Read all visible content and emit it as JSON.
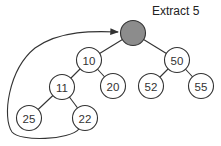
{
  "title": "Extract 5",
  "colors": {
    "node_fill": "#ffffff",
    "node_stroke": "#333333",
    "extracted_fill": "#8c8c8c",
    "edge": "#333333"
  },
  "nodes": [
    {
      "id": "root",
      "label": "",
      "x": 133,
      "y": 33,
      "extracted": true
    },
    {
      "id": "n10",
      "label": "10",
      "x": 89,
      "y": 60
    },
    {
      "id": "n50",
      "label": "50",
      "x": 177,
      "y": 60
    },
    {
      "id": "n11",
      "label": "11",
      "x": 62,
      "y": 87
    },
    {
      "id": "n20",
      "label": "20",
      "x": 113,
      "y": 86
    },
    {
      "id": "n52",
      "label": "52",
      "x": 151,
      "y": 86
    },
    {
      "id": "n55",
      "label": "55",
      "x": 201,
      "y": 86
    },
    {
      "id": "n25",
      "label": "25",
      "x": 29,
      "y": 118
    },
    {
      "id": "n22",
      "label": "22",
      "x": 85,
      "y": 118
    }
  ],
  "edges": [
    [
      "root",
      "n10"
    ],
    [
      "root",
      "n50"
    ],
    [
      "n10",
      "n11"
    ],
    [
      "n10",
      "n20"
    ],
    [
      "n50",
      "n52"
    ],
    [
      "n50",
      "n55"
    ],
    [
      "n11",
      "n25"
    ],
    [
      "n11",
      "n22"
    ]
  ],
  "arrow": {
    "from": "n22",
    "to": "root",
    "description": "last element moved to root"
  }
}
